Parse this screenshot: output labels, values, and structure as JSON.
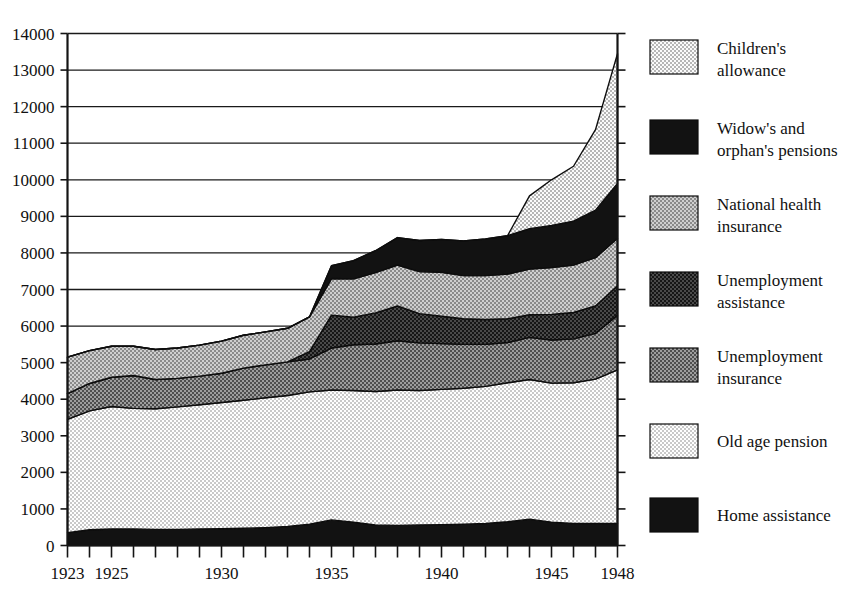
{
  "chart_data": {
    "type": "area",
    "title": "",
    "subtitle": "",
    "xlabel": "",
    "ylabel": "",
    "stacked": true,
    "grid": true,
    "legend_position": "right",
    "xlim": [
      1923,
      1948
    ],
    "ylim": [
      0,
      14000
    ],
    "y_tick_step": 1000,
    "x": [
      1923,
      1924,
      1925,
      1926,
      1927,
      1928,
      1929,
      1930,
      1931,
      1932,
      1933,
      1934,
      1935,
      1936,
      1937,
      1938,
      1939,
      1940,
      1941,
      1942,
      1943,
      1944,
      1945,
      1946,
      1947,
      1948
    ],
    "x_tick_labels": [
      "1923",
      "1925",
      "1930",
      "1935",
      "1940",
      "1945",
      "1948"
    ],
    "x_tick_values": [
      1923,
      1925,
      1930,
      1935,
      1940,
      1945,
      1948
    ],
    "y_tick_labels": [
      "0",
      "1000",
      "2000",
      "3000",
      "4000",
      "5000",
      "6000",
      "7000",
      "8000",
      "9000",
      "10000",
      "11000",
      "12000",
      "13000",
      "14000"
    ],
    "y_tick_values": [
      0,
      1000,
      2000,
      3000,
      4000,
      5000,
      6000,
      7000,
      8000,
      9000,
      10000,
      11000,
      12000,
      13000,
      14000
    ],
    "series": [
      {
        "name": "Home assistance",
        "fill": "#121212",
        "pattern": "solid-black",
        "values": [
          350,
          430,
          450,
          450,
          440,
          440,
          450,
          460,
          470,
          490,
          520,
          580,
          700,
          640,
          560,
          550,
          560,
          570,
          580,
          600,
          650,
          720,
          640,
          600,
          600,
          600
        ]
      },
      {
        "name": "Old age pension",
        "fill": "#e3e3e3",
        "pattern": "light-dots",
        "values": [
          3100,
          3250,
          3350,
          3300,
          3300,
          3350,
          3400,
          3450,
          3500,
          3550,
          3580,
          3620,
          3550,
          3600,
          3650,
          3700,
          3680,
          3700,
          3720,
          3750,
          3800,
          3820,
          3800,
          3850,
          3950,
          4200
        ]
      },
      {
        "name": "Unemployment insurance",
        "fill": "#8f8f8f",
        "pattern": "medium-weave",
        "values": [
          700,
          750,
          800,
          900,
          800,
          780,
          780,
          800,
          880,
          900,
          920,
          900,
          1150,
          1250,
          1300,
          1350,
          1300,
          1250,
          1200,
          1150,
          1100,
          1150,
          1180,
          1200,
          1250,
          1500
        ]
      },
      {
        "name": "Unemployment assistance",
        "fill": "#3a3a3a",
        "pattern": "dark-weave",
        "values": [
          0,
          0,
          0,
          0,
          0,
          0,
          0,
          0,
          0,
          0,
          0,
          200,
          900,
          750,
          850,
          950,
          800,
          750,
          700,
          680,
          650,
          620,
          700,
          720,
          750,
          800
        ]
      },
      {
        "name": "National health insurance",
        "fill": "#b8b8b8",
        "pattern": "gray-dots",
        "values": [
          1000,
          900,
          850,
          800,
          820,
          830,
          850,
          880,
          900,
          900,
          920,
          950,
          1000,
          1050,
          1100,
          1120,
          1150,
          1200,
          1180,
          1200,
          1220,
          1250,
          1280,
          1300,
          1320,
          1300
        ]
      },
      {
        "name": "Widow's and orphan's pensions",
        "fill": "#151515",
        "pattern": "solid-black",
        "values": [
          0,
          0,
          0,
          0,
          0,
          0,
          0,
          0,
          0,
          0,
          0,
          0,
          350,
          500,
          600,
          750,
          850,
          900,
          950,
          1000,
          1050,
          1100,
          1150,
          1200,
          1300,
          1500
        ]
      },
      {
        "name": "Children's allowance",
        "fill": "#dcdcdc",
        "pattern": "check-light",
        "values": [
          0,
          0,
          0,
          0,
          0,
          0,
          0,
          0,
          0,
          0,
          0,
          0,
          0,
          0,
          0,
          0,
          0,
          0,
          0,
          0,
          0,
          900,
          1250,
          1500,
          2200,
          3550
        ]
      }
    ],
    "totals": [
      5150,
      5330,
      5450,
      5450,
      5360,
      5400,
      5480,
      5590,
      5750,
      5840,
      5940,
      6250,
      7650,
      7790,
      8060,
      8420,
      8340,
      8370,
      8330,
      8380,
      8470,
      9560,
      9750,
      10370,
      11370,
      13450
    ]
  },
  "legend": {
    "items": [
      {
        "label_line1": "Children's",
        "label_line2": "allowance",
        "pattern": "check-light"
      },
      {
        "label_line1": "Widow's and",
        "label_line2": "orphan's pensions",
        "pattern": "solid-black"
      },
      {
        "label_line1": "National health",
        "label_line2": "insurance",
        "pattern": "gray-dots"
      },
      {
        "label_line1": "Unemployment",
        "label_line2": "assistance",
        "pattern": "dark-weave"
      },
      {
        "label_line1": "Unemployment",
        "label_line2": "insurance",
        "pattern": "medium-weave"
      },
      {
        "label_line1": "Old age pension",
        "label_line2": "",
        "pattern": "light-dots"
      },
      {
        "label_line1": "Home assistance",
        "label_line2": "",
        "pattern": "solid-black"
      }
    ]
  }
}
